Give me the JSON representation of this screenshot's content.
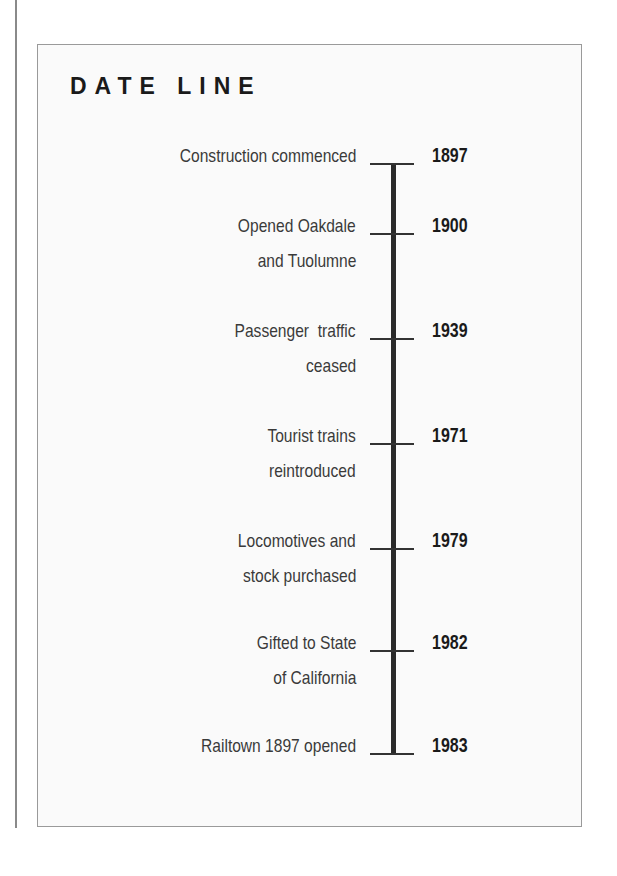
{
  "title": "DATE LINE",
  "events": [
    {
      "year": "1897",
      "lines": [
        "Construction commenced"
      ]
    },
    {
      "year": "1900",
      "lines": [
        "Opened Oakdale",
        "and Tuolumne"
      ]
    },
    {
      "year": "1939",
      "lines": [
        "Passenger  traffic",
        "ceased"
      ]
    },
    {
      "year": "1971",
      "lines": [
        "Tourist trains",
        "reintroduced"
      ]
    },
    {
      "year": "1979",
      "lines": [
        "Locomotives and",
        "stock purchased"
      ]
    },
    {
      "year": "1982",
      "lines": [
        "Gifted to State",
        "of California"
      ]
    },
    {
      "year": "1983",
      "lines": [
        "Railtown 1897 opened"
      ]
    }
  ]
}
